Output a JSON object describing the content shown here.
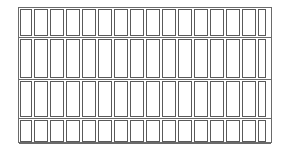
{
  "diagram": {
    "type": "grid-of-rectangles",
    "columns": 16,
    "rows": [
      {
        "top": 1,
        "height": 27
      },
      {
        "top": 31,
        "height": 39
      },
      {
        "top": 73,
        "height": 36
      },
      {
        "top": 112,
        "height": 22
      }
    ],
    "cell_widths": [
      12,
      14,
      14,
      14,
      14,
      14,
      14,
      14,
      14,
      14,
      14,
      14,
      14,
      14,
      14,
      8
    ],
    "stroke_color": "#5a5a5a",
    "background_color": "#ffffff"
  }
}
